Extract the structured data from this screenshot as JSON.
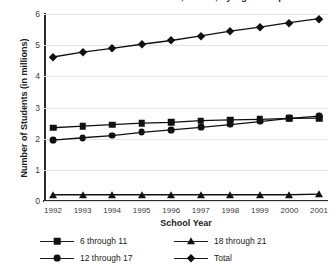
{
  "chart_data": {
    "type": "line",
    "title": "Students Served Under IDEA, Part B, by Age Group",
    "xlabel": "School Year",
    "ylabel": "Number of Students (in millions)",
    "x": [
      1992,
      1993,
      1994,
      1995,
      1996,
      1997,
      1998,
      1999,
      2000,
      2001
    ],
    "xtick_labels": [
      "1992",
      "1993",
      "1994",
      "1995",
      "1996",
      "1997",
      "1998",
      "1999",
      "2000",
      "2001"
    ],
    "ytick_labels": [
      "0",
      "1",
      "2",
      "3",
      "4",
      "5",
      "6"
    ],
    "yticks": [
      0,
      1,
      2,
      3,
      4,
      5,
      6
    ],
    "ylim": [
      0,
      6
    ],
    "xlim": [
      1992,
      2001
    ],
    "grid": true,
    "legend_position": "bottom",
    "series": [
      {
        "name": "6 through 11",
        "marker": "square",
        "values": [
          2.35,
          2.4,
          2.45,
          2.5,
          2.52,
          2.58,
          2.6,
          2.62,
          2.65,
          2.66
        ]
      },
      {
        "name": "12 through 17",
        "marker": "circle",
        "values": [
          1.95,
          2.03,
          2.1,
          2.2,
          2.28,
          2.36,
          2.45,
          2.55,
          2.65,
          2.72
        ]
      },
      {
        "name": "18 through 21",
        "marker": "triangle",
        "values": [
          0.2,
          0.2,
          0.2,
          0.2,
          0.2,
          0.2,
          0.2,
          0.2,
          0.2,
          0.22
        ]
      },
      {
        "name": "Total",
        "marker": "diamond",
        "values": [
          4.62,
          4.78,
          4.9,
          5.03,
          5.15,
          5.3,
          5.45,
          5.58,
          5.72,
          5.85
        ]
      }
    ]
  },
  "colors": {
    "series": "#111111",
    "axis": "#2b2b2b",
    "grid": "#e3e3e3",
    "text": "#1a1a1a"
  }
}
